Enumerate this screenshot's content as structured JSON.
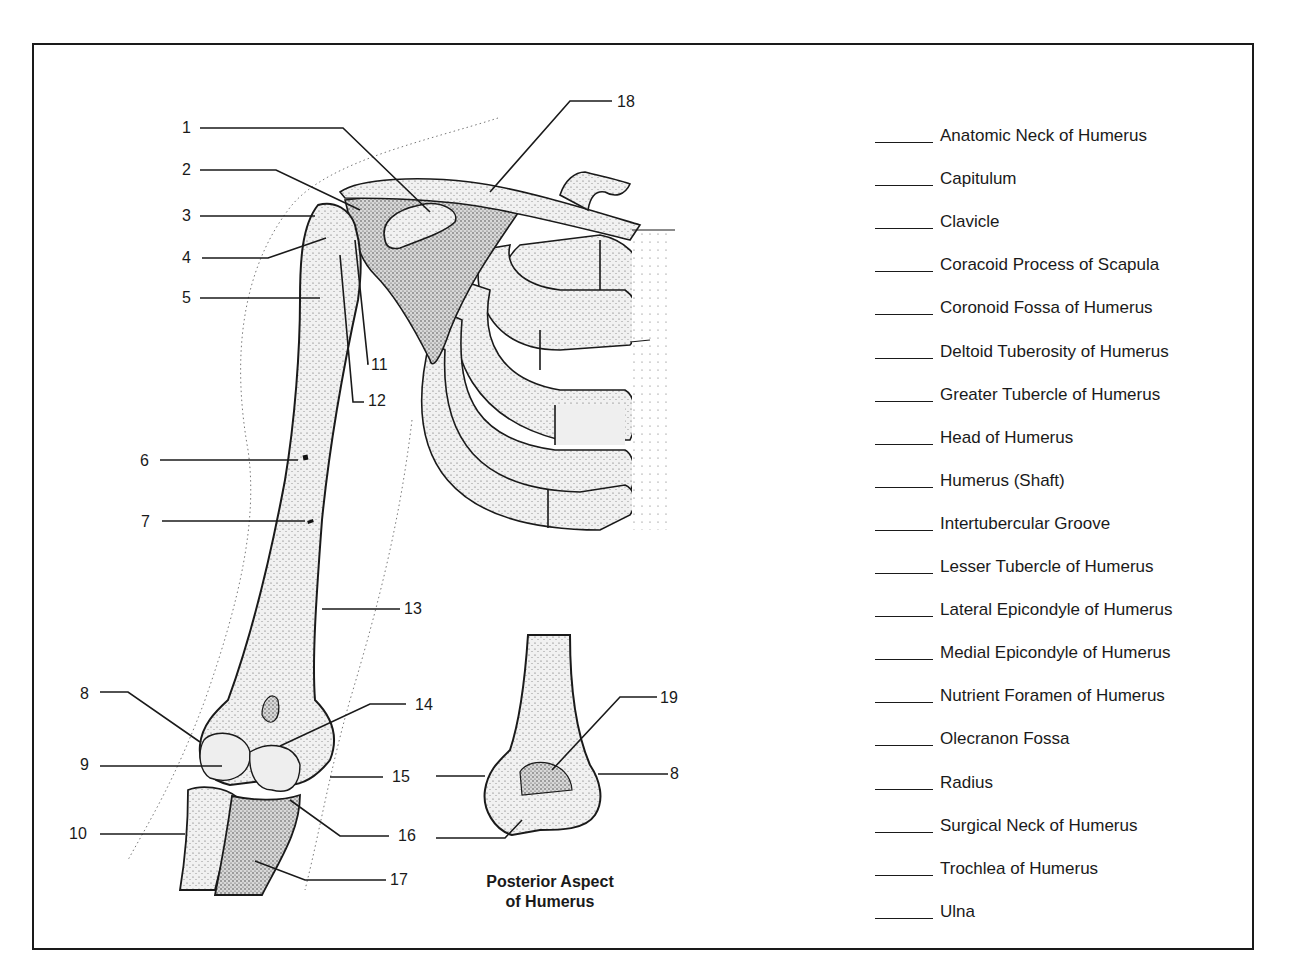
{
  "figure": {
    "caption_line1": "Posterior Aspect",
    "caption_line2": "of Humerus",
    "callouts": [
      {
        "n": "1"
      },
      {
        "n": "2"
      },
      {
        "n": "3"
      },
      {
        "n": "4"
      },
      {
        "n": "5"
      },
      {
        "n": "6"
      },
      {
        "n": "7"
      },
      {
        "n": "8"
      },
      {
        "n": "9"
      },
      {
        "n": "10"
      },
      {
        "n": "11"
      },
      {
        "n": "12"
      },
      {
        "n": "13"
      },
      {
        "n": "14"
      },
      {
        "n": "15"
      },
      {
        "n": "16"
      },
      {
        "n": "17"
      },
      {
        "n": "18"
      },
      {
        "n": "19"
      },
      {
        "n": "8"
      }
    ]
  },
  "terms": [
    {
      "label": "Anatomic Neck of Humerus",
      "answer": ""
    },
    {
      "label": "Capitulum",
      "answer": ""
    },
    {
      "label": "Clavicle",
      "answer": ""
    },
    {
      "label": "Coracoid Process of Scapula",
      "answer": ""
    },
    {
      "label": "Coronoid Fossa of Humerus",
      "answer": ""
    },
    {
      "label": "Deltoid Tuberosity of Humerus",
      "answer": ""
    },
    {
      "label": "Greater Tubercle of Humerus",
      "answer": ""
    },
    {
      "label": "Head of Humerus",
      "answer": ""
    },
    {
      "label": "Humerus (Shaft)",
      "answer": ""
    },
    {
      "label": "Intertubercular Groove",
      "answer": ""
    },
    {
      "label": "Lesser Tubercle of Humerus",
      "answer": ""
    },
    {
      "label": "Lateral Epicondyle of Humerus",
      "answer": ""
    },
    {
      "label": "Medial Epicondyle of Humerus",
      "answer": ""
    },
    {
      "label": "Nutrient Foramen of Humerus",
      "answer": ""
    },
    {
      "label": "Olecranon Fossa",
      "answer": ""
    },
    {
      "label": "Radius",
      "answer": ""
    },
    {
      "label": "Surgical Neck of Humerus",
      "answer": ""
    },
    {
      "label": "Trochlea of Humerus",
      "answer": ""
    },
    {
      "label": "Ulna",
      "answer": ""
    }
  ]
}
